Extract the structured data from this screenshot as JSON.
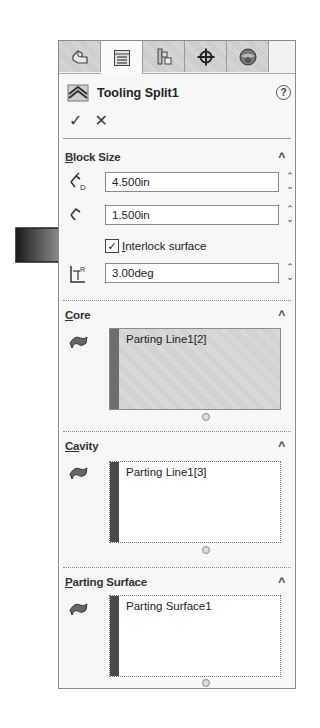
{
  "tabs": [
    {
      "name": "feature-manager",
      "icon": "part-icon",
      "active": false
    },
    {
      "name": "property-manager",
      "icon": "list-icon",
      "active": true
    },
    {
      "name": "configuration-manager",
      "icon": "config-icon",
      "active": false
    },
    {
      "name": "dimxpert-manager",
      "icon": "crosshair-icon",
      "active": false
    },
    {
      "name": "display-manager",
      "icon": "sphere-icon",
      "active": false
    }
  ],
  "header": {
    "title": "Tooling Split1",
    "help_label": "?",
    "ok_label": "✓",
    "cancel_label": "✕"
  },
  "block_size": {
    "title_first": "B",
    "title_rest": "lock Size",
    "depth_value": "4.500in",
    "depth_icon_label": "D",
    "height_value": "1.500in",
    "interlock_label_first": "I",
    "interlock_label_rest": "nterlock surface",
    "interlock_checked": true,
    "draft_value": "3.00deg",
    "draft_icon_label": "R"
  },
  "core": {
    "title_first": "C",
    "title_rest": "ore",
    "items": [
      "Parting Line1[2]"
    ]
  },
  "cavity": {
    "title_first": "Ca",
    "title_rest": "vity",
    "items": [
      "Parting Line1[3]"
    ]
  },
  "parting_surface": {
    "title_first": "P",
    "title_rest": "arting Surface",
    "items": [
      "Parting Surface1"
    ]
  },
  "glyphs": {
    "chevron_up": "^",
    "spin_up": "⌃",
    "spin_down": "⌄",
    "check": "✓"
  }
}
